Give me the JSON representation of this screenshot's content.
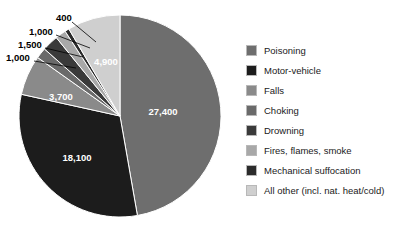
{
  "chart_data": {
    "type": "pie",
    "title": "",
    "subtitle": "",
    "xlabel": "",
    "ylabel": "",
    "legend_position": "right",
    "grid": false,
    "total": 57600,
    "start_angle_deg": 0,
    "direction": "clockwise",
    "categories": [
      "Poisoning",
      "Motor-vehicle",
      "Falls",
      "Choking",
      "Drowning",
      "Fires, flames, smoke",
      "Mechanical suffocation",
      "All other (incl. nat. heat/cold)"
    ],
    "values": [
      27400,
      18100,
      3700,
      1000,
      1500,
      1000,
      400,
      4900
    ],
    "value_labels": [
      "27,400",
      "18,100",
      "3,700",
      "1,000",
      "1,500",
      "1,000",
      "400",
      "4,900"
    ],
    "colors": [
      "#6e6e6e",
      "#1c1c1c",
      "#8a8a8a",
      "#6a6a6a",
      "#3a3a3a",
      "#a8a8a8",
      "#2b2b2b",
      "#cfcfcf"
    ],
    "label_placement": [
      "inside",
      "inside",
      "inside",
      "callout",
      "callout",
      "callout",
      "callout",
      "inside"
    ]
  },
  "legend": {
    "items": [
      {
        "label": "Poisoning",
        "color": "#6e6e6e"
      },
      {
        "label": "Motor-vehicle",
        "color": "#1c1c1c"
      },
      {
        "label": "Falls",
        "color": "#8a8a8a"
      },
      {
        "label": "Choking",
        "color": "#6a6a6a"
      },
      {
        "label": "Drowning",
        "color": "#3a3a3a"
      },
      {
        "label": "Fires, flames, smoke",
        "color": "#a8a8a8"
      },
      {
        "label": "Mechanical suffocation",
        "color": "#2b2b2b"
      },
      {
        "label": "All other (incl. nat. heat/cold)",
        "color": "#cfcfcf"
      }
    ]
  },
  "pie_labels": {
    "inside": [
      {
        "text": "27,400",
        "x": 163,
        "y": 112
      },
      {
        "text": "18,100",
        "x": 77,
        "y": 158
      },
      {
        "text": "3,700",
        "x": 61,
        "y": 97
      },
      {
        "text": "4,900",
        "x": 106,
        "y": 62
      }
    ],
    "callouts": [
      {
        "text": "400",
        "x": 56,
        "y": 18,
        "lx1": 72,
        "ly1": 22,
        "lx2": 96,
        "ly2": 42
      },
      {
        "text": "1,000",
        "x": 29,
        "y": 32,
        "lx1": 56,
        "ly1": 35,
        "lx2": 90,
        "ly2": 48
      },
      {
        "text": "1,500",
        "x": 18,
        "y": 45,
        "lx1": 45,
        "ly1": 48,
        "lx2": 83,
        "ly2": 57
      },
      {
        "text": "1,000",
        "x": 6,
        "y": 58,
        "lx1": 34,
        "ly1": 61,
        "lx2": 76,
        "ly2": 68
      }
    ]
  }
}
